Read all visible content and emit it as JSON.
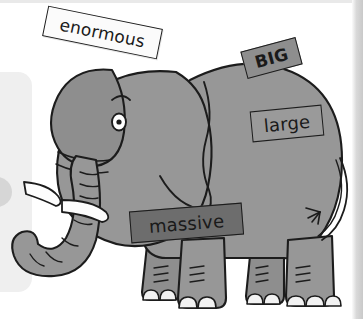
{
  "scene": {
    "title": "Elephant synonym word labels",
    "subject": "elephant-illustration",
    "background_color": "#ffffff"
  },
  "colors": {
    "body_fill": "#979797",
    "body_shade": "#8b8b8b",
    "outline": "#1c1c1c",
    "tusk_fill": "#fdfdfd",
    "toenail_fill": "#f2f2f2",
    "eye_white": "#ffffff",
    "eye_pupil": "#1c1c1c",
    "label_light": "#fbfbfb",
    "label_mid": "#9a9a9a",
    "label_dark_mid": "#8e8e8e",
    "label_dark": "#6d6d6d",
    "page_panel": "#efefef",
    "page_dot": "#d6d6d6",
    "right_strip": "#c9c9c9"
  },
  "labels": [
    {
      "id": "enormous",
      "text": "enormous",
      "rotation_deg": 11.5,
      "style": "light"
    },
    {
      "id": "big",
      "text": "BIG",
      "rotation_deg": -15.0,
      "style": "dark-mid"
    },
    {
      "id": "large",
      "text": "large",
      "rotation_deg": -5.5,
      "style": "mid"
    },
    {
      "id": "massive",
      "text": "massive",
      "rotation_deg": -4.5,
      "style": "dark"
    }
  ],
  "elephant_parts": [
    "ear",
    "eye",
    "eyebrow",
    "trunk",
    "tusk-left",
    "tusk-right",
    "head",
    "body",
    "front-leg-near",
    "front-leg-far",
    "rear-leg-near",
    "rear-leg-far",
    "tail",
    "tail-tuft",
    "toenails"
  ],
  "icons": {
    "elephant": "elephant-icon",
    "eye": "eye-icon",
    "tail": "tail-icon"
  }
}
